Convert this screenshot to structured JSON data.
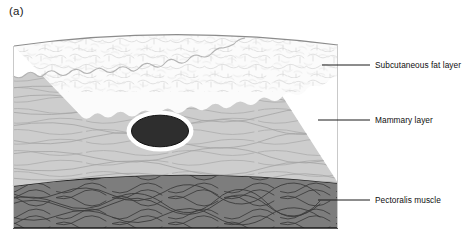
{
  "figure": {
    "panel_letter": "(a)",
    "width": 467,
    "height": 242
  },
  "layers": [
    {
      "id": "skin",
      "name": "skin-surface-line",
      "color": "#8c8c8c",
      "label": null
    },
    {
      "id": "fat",
      "name": "subcutaneous-fat-layer",
      "label": "Subcutaneous fat layer",
      "color": "#fbfbfb",
      "outline_color": "#b5b5b5",
      "texture": "lobular-adipose-cells"
    },
    {
      "id": "mammary",
      "name": "mammary-layer",
      "label": "Mammary layer",
      "color": "#cdcdcd",
      "outline_color": "#9a9a9a",
      "texture": "horizontal-fibroglandular-strands"
    },
    {
      "id": "muscle",
      "name": "pectoralis-muscle",
      "label": "Pectoralis muscle",
      "color": "#7d7d7d",
      "outline_color": "#1f1f1f",
      "texture": "interlacing-muscle-fibers"
    }
  ],
  "lesion": {
    "name": "tumor-lesion",
    "fill": "#2e2e2e",
    "halo_color": "#ffffff",
    "center_x": 160,
    "center_y": 131,
    "radius_x": 29,
    "radius_y": 16,
    "halo_width": 5
  },
  "callouts": [
    {
      "id": "fat",
      "text": "Subcutaneous fat layer",
      "leader_x1": 322,
      "leader_x2": 370,
      "leader_y": 65
    },
    {
      "id": "mammary",
      "text": "Mammary layer",
      "leader_x1": 318,
      "leader_x2": 370,
      "leader_y": 120
    },
    {
      "id": "muscle",
      "text": "Pectoralis muscle",
      "leader_x1": 318,
      "leader_x2": 370,
      "leader_y": 200
    }
  ],
  "leader_line_color": "#1a1a1a"
}
